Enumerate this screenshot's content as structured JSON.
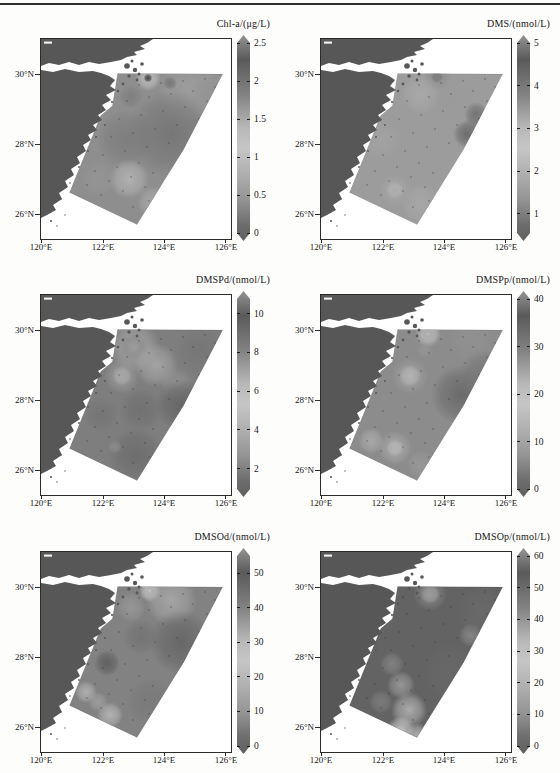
{
  "page": {
    "top_rule_color": "#2f2f2f",
    "background": "#fdfdfc"
  },
  "axes": {
    "x_ticks": [
      {
        "label": "120°E"
      },
      {
        "label": "122°E"
      },
      {
        "label": "124°E"
      },
      {
        "label": "126°E"
      }
    ],
    "y_ticks": [
      {
        "label": "30°N"
      },
      {
        "label": "28°N"
      },
      {
        "label": "26°N"
      }
    ]
  },
  "map": {
    "land_color": "#575757",
    "sea_color": "#ffffff",
    "lon_labels_range": [
      120,
      126
    ],
    "lat_labels_range": [
      26,
      30
    ],
    "north_land_path": "M0,0 L112,0 L106,4 L99,7 L104,10 L93,13 L96,16 L86,18 L80,21 L70,23 L58,25 L48,23 L38,26 L28,23 L18,26 L8,24 L0,27 Z",
    "south_land_path": "M0,31 L12,33 L24,30 L38,33 L52,32 L60,34 L68,37 L74,41 L69,47 L75,51 L65,56 L70,61 L61,66 L65,71 L57,76 L61,81 L52,86 L56,91 L47,96 L50,101 L42,106 L45,112 L36,118 L39,124 L30,130 L33,136 L24,142 L27,148 L18,154 L21,160 L12,166 L15,171 L6,176 L0,179 Z",
    "islands": [
      [
        86,
        27,
        2.8
      ],
      [
        94,
        31,
        2.2
      ],
      [
        101,
        25,
        1.8
      ],
      [
        91,
        22,
        1.5
      ],
      [
        98,
        35,
        1.5
      ],
      [
        88,
        37,
        1.7
      ],
      [
        96,
        41,
        1.4
      ],
      [
        82,
        45,
        1.4
      ],
      [
        77,
        52,
        1.2
      ],
      [
        71,
        63,
        1.1
      ],
      [
        64,
        86,
        1.0
      ],
      [
        55,
        98,
        1.0
      ],
      [
        47,
        112,
        0.9
      ],
      [
        38,
        128,
        0.9
      ],
      [
        29,
        144,
        0.8
      ],
      [
        20,
        160,
        0.8
      ],
      [
        10,
        182,
        1.0
      ],
      [
        16,
        187,
        0.7
      ],
      [
        24,
        176,
        0.7
      ]
    ],
    "survey_polygon": "M76.6,34.4 L181.7,35.1 L142.5,110.6 L96,185.5 L28.5,153.4 L59.8,76.5 L71.4,66.7 Z",
    "stations": [
      [
        98,
        46
      ],
      [
        120,
        44
      ],
      [
        142,
        42
      ],
      [
        164,
        40
      ],
      [
        86,
        62
      ],
      [
        108,
        58
      ],
      [
        130,
        55
      ],
      [
        152,
        52
      ],
      [
        174,
        48
      ],
      [
        78,
        80
      ],
      [
        100,
        76
      ],
      [
        122,
        72
      ],
      [
        144,
        68
      ],
      [
        166,
        62
      ],
      [
        70,
        98
      ],
      [
        92,
        94
      ],
      [
        114,
        90
      ],
      [
        136,
        86
      ],
      [
        158,
        80
      ],
      [
        62,
        116
      ],
      [
        84,
        112
      ],
      [
        106,
        108
      ],
      [
        128,
        104
      ],
      [
        54,
        132
      ],
      [
        76,
        128
      ],
      [
        98,
        124
      ],
      [
        46,
        146
      ],
      [
        68,
        142
      ],
      [
        90,
        138
      ],
      [
        112,
        134
      ],
      [
        60,
        156
      ],
      [
        82,
        152
      ],
      [
        104,
        148
      ],
      [
        92,
        168
      ],
      [
        108,
        162
      ]
    ]
  },
  "colorbar": {
    "stops": [
      [
        0,
        "#949494"
      ],
      [
        0.12,
        "#5a5a5a"
      ],
      [
        0.3,
        "#858585"
      ],
      [
        0.45,
        "#b8b8b8"
      ],
      [
        0.55,
        "#c6c6c6"
      ],
      [
        0.68,
        "#aeaeae"
      ],
      [
        0.8,
        "#949494"
      ],
      [
        0.92,
        "#6d6d6d"
      ],
      [
        1,
        "#606060"
      ]
    ]
  },
  "panels": [
    {
      "title": "Chl-a/(μg/L)",
      "base": "#8e8e8e",
      "colorbar": {
        "min": 0,
        "max": 2.5,
        "ticks": [
          {
            "v": 0,
            "label": "0"
          },
          {
            "v": 0.5,
            "label": "0.5"
          },
          {
            "v": 1,
            "label": "1"
          },
          {
            "v": 1.5,
            "label": "1.5"
          },
          {
            "v": 2,
            "label": "2"
          },
          {
            "v": 2.5,
            "label": "2.5"
          }
        ]
      },
      "blobs": [
        [
          150,
          52,
          34,
          "#9f9f9f",
          0.9
        ],
        [
          107,
          39,
          13,
          "#bdbdbd",
          1
        ],
        [
          107,
          39,
          4.5,
          "#3e3e3e",
          1
        ],
        [
          129,
          44,
          7,
          "#6f6f6f",
          0.8
        ],
        [
          90,
          58,
          12,
          "#7c7c7c",
          0.8
        ],
        [
          130,
          95,
          45,
          "#747474",
          0.9
        ],
        [
          85,
          100,
          30,
          "#7a7a7a",
          0.8
        ],
        [
          88,
          140,
          20,
          "#b2b2b2",
          0.95
        ],
        [
          112,
          163,
          16,
          "#ababab",
          0.85
        ],
        [
          58,
          140,
          18,
          "#989898",
          0.6
        ],
        [
          165,
          55,
          18,
          "#8f8f8f",
          0.5
        ]
      ]
    },
    {
      "title": "DMS/(nmol/L)",
      "base": "#9c9c9c",
      "colorbar": {
        "min": 0.55,
        "max": 5,
        "ticks": [
          {
            "v": 1,
            "label": "1"
          },
          {
            "v": 2,
            "label": "2"
          },
          {
            "v": 3,
            "label": "3"
          },
          {
            "v": 4,
            "label": "4"
          },
          {
            "v": 5,
            "label": "5"
          }
        ]
      },
      "blobs": [
        [
          116,
          38,
          6,
          "#4f4f4f",
          1
        ],
        [
          116,
          38,
          14,
          "#8a8a8a",
          0.8
        ],
        [
          100,
          55,
          20,
          "#ababab",
          0.8
        ],
        [
          155,
          75,
          12,
          "#6e6e6e",
          0.9
        ],
        [
          146,
          95,
          14,
          "#666666",
          0.9
        ],
        [
          160,
          88,
          18,
          "#777777",
          0.7
        ],
        [
          74,
          151,
          3,
          "#454545",
          1
        ],
        [
          74,
          151,
          9,
          "#c2c2c2",
          0.95
        ],
        [
          74,
          151,
          16,
          "#a8a8a8",
          0.7
        ],
        [
          100,
          165,
          20,
          "#ababab",
          0.7
        ],
        [
          60,
          100,
          20,
          "#a5a5a5",
          0.6
        ],
        [
          130,
          60,
          25,
          "#999999",
          0.5
        ]
      ]
    },
    {
      "title": "DMSPd/(nmol/L)",
      "base": "#7e7e7e",
      "colorbar": {
        "min": 0.95,
        "max": 10.75,
        "ticks": [
          {
            "v": 2,
            "label": "2"
          },
          {
            "v": 4,
            "label": "4"
          },
          {
            "v": 6,
            "label": "6"
          },
          {
            "v": 8,
            "label": "8"
          },
          {
            "v": 10,
            "label": "10"
          }
        ]
      },
      "blobs": [
        [
          93,
          52,
          13,
          "#4c4c4c",
          1
        ],
        [
          93,
          52,
          26,
          "#a6a6a6",
          0.9
        ],
        [
          81,
          81,
          4,
          "#3f3f3f",
          1
        ],
        [
          81,
          81,
          10,
          "#bdbdbd",
          1
        ],
        [
          81,
          81,
          18,
          "#a0a0a0",
          0.7
        ],
        [
          115,
          70,
          22,
          "#a9a9a9",
          0.85
        ],
        [
          135,
          88,
          16,
          "#9b9b9b",
          0.6
        ],
        [
          160,
          55,
          26,
          "#747474",
          0.75
        ],
        [
          140,
          110,
          26,
          "#646464",
          0.9
        ],
        [
          100,
          115,
          22,
          "#6e6e6e",
          0.8
        ],
        [
          160,
          95,
          9,
          "#ababab",
          0.9
        ],
        [
          95,
          160,
          28,
          "#6b6b6b",
          0.85
        ],
        [
          74,
          152,
          7,
          "#8f8f8f",
          0.8
        ],
        [
          60,
          120,
          18,
          "#707070",
          0.6
        ]
      ]
    },
    {
      "title": "DMSPp/(nmol/L)",
      "base": "#8c8c8c",
      "colorbar": {
        "min": 0,
        "max": 40,
        "ticks": [
          {
            "v": 0,
            "label": "0"
          },
          {
            "v": 10,
            "label": "10"
          },
          {
            "v": 20,
            "label": "20"
          },
          {
            "v": 30,
            "label": "30"
          },
          {
            "v": 40,
            "label": "40"
          }
        ]
      },
      "blobs": [
        [
          107,
          39,
          5,
          "#3c3c3c",
          1
        ],
        [
          107,
          39,
          13,
          "#c0c0c0",
          0.95
        ],
        [
          104,
          55,
          8,
          "#9a9a9a",
          0.6
        ],
        [
          89,
          81,
          11,
          "#c4c4c4",
          0.95
        ],
        [
          89,
          81,
          18,
          "#a8a8a8",
          0.6
        ],
        [
          140,
          100,
          30,
          "#676767",
          0.9
        ],
        [
          160,
          75,
          20,
          "#737373",
          0.7
        ],
        [
          74,
          153,
          2.5,
          "#555555",
          1
        ],
        [
          74,
          153,
          9,
          "#cacaca",
          1
        ],
        [
          74,
          153,
          17,
          "#adadad",
          0.75
        ],
        [
          50,
          146,
          13,
          "#b0b0b0",
          0.8
        ],
        [
          100,
          170,
          15,
          "#9e9e9e",
          0.6
        ],
        [
          150,
          45,
          22,
          "#959595",
          0.5
        ]
      ]
    },
    {
      "title": "DMSOd/(nmol/L)",
      "base": "#828282",
      "colorbar": {
        "min": 0,
        "max": 55,
        "ticks": [
          {
            "v": 0,
            "label": "0"
          },
          {
            "v": 10,
            "label": "10"
          },
          {
            "v": 20,
            "label": "20"
          },
          {
            "v": 30,
            "label": "30"
          },
          {
            "v": 40,
            "label": "40"
          },
          {
            "v": 50,
            "label": "50"
          }
        ]
      },
      "blobs": [
        [
          109,
          39,
          4.5,
          "#383838",
          1
        ],
        [
          109,
          39,
          11,
          "#c6c6c6",
          1
        ],
        [
          130,
          48,
          26,
          "#aaaaaa",
          0.85
        ],
        [
          90,
          55,
          15,
          "#9e9e9e",
          0.7
        ],
        [
          140,
          90,
          32,
          "#646464",
          0.9
        ],
        [
          100,
          85,
          18,
          "#6e6e6e",
          0.7
        ],
        [
          66,
          111,
          13,
          "#5c5c5c",
          0.9
        ],
        [
          45,
          140,
          11,
          "#b4b4b4",
          0.9
        ],
        [
          69,
          163,
          13,
          "#b8b8b8",
          0.9
        ],
        [
          57,
          150,
          10,
          "#a8a8a8",
          0.7
        ],
        [
          110,
          150,
          25,
          "#747474",
          0.6
        ],
        [
          150,
          120,
          18,
          "#6e6e6e",
          0.6
        ]
      ]
    },
    {
      "title": "DMSOp/(nmol/L)",
      "base": "#636363",
      "colorbar": {
        "min": 0,
        "max": 60,
        "ticks": [
          {
            "v": 0,
            "label": "0"
          },
          {
            "v": 10,
            "label": "10"
          },
          {
            "v": 20,
            "label": "20"
          },
          {
            "v": 30,
            "label": "30"
          },
          {
            "v": 40,
            "label": "40"
          },
          {
            "v": 50,
            "label": "50"
          },
          {
            "v": 60,
            "label": "60"
          }
        ]
      },
      "blobs": [
        [
          109,
          42,
          10,
          "#b8b8b8",
          1
        ],
        [
          109,
          42,
          17,
          "#8e8e8e",
          0.7
        ],
        [
          150,
          83,
          12,
          "#888888",
          0.9
        ],
        [
          71,
          112,
          12,
          "#8a8a8a",
          0.8
        ],
        [
          80,
          133,
          14,
          "#9e9e9e",
          0.85
        ],
        [
          88,
          158,
          18,
          "#aeaeae",
          0.95
        ],
        [
          80,
          178,
          14,
          "#c2c2c2",
          1
        ],
        [
          96,
          183,
          12,
          "#b5b5b5",
          0.9
        ],
        [
          60,
          150,
          12,
          "#868686",
          0.7
        ],
        [
          130,
          120,
          30,
          "#6a6a6a",
          0.6
        ],
        [
          160,
          60,
          25,
          "#6d6d6d",
          0.6
        ]
      ]
    }
  ]
}
